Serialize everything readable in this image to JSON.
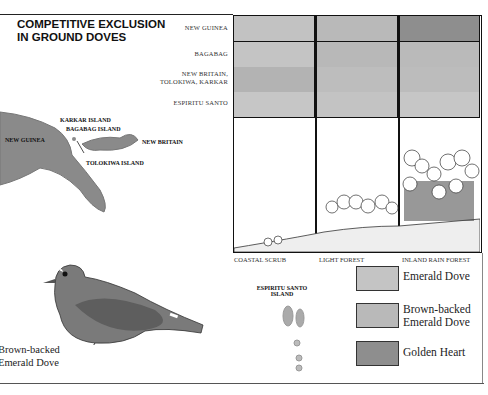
{
  "title": {
    "line1": "COMPETITIVE EXCLUSION",
    "line2": "IN GROUND DOVES"
  },
  "rows": [
    {
      "label_lines": [
        "NEW GUINEA"
      ],
      "colors": [
        "#c2c2c2",
        "#b9b9b9",
        "#8e8e8e"
      ]
    },
    {
      "label_lines": [
        "BAGABAG"
      ],
      "colors": [
        "#c4c4c4",
        "#b8b8b8",
        "#bababa"
      ]
    },
    {
      "label_lines": [
        "NEW BRITAIN,",
        "TOLOKIWA, KARKAR"
      ],
      "colors": [
        "#b3b3b3",
        "#bdbdbd",
        "#bcbcbc"
      ]
    },
    {
      "label_lines": [
        "ESPIRITU SANTO"
      ],
      "colors": [
        "#c6c6c6",
        "#c3c3c3",
        "#c6c6c6"
      ]
    }
  ],
  "habitats": [
    "COASTAL SCRUB",
    "LIGHT FOREST",
    "INLAND RAIN FOREST"
  ],
  "map_labels": {
    "karkar": "KARKAR ISLAND",
    "bagabag": "BAGABAG ISLAND",
    "new_guinea": "NEW GUINEA",
    "new_britain": "NEW BRITAIN",
    "tolokiwa": "TOLOKIWA ISLAND",
    "espiritu": "ESPIRITU SANTO",
    "espiritu2": "ISLAND"
  },
  "legend": [
    {
      "label_lines": [
        "Emerald Dove"
      ],
      "color": "#c4c4c4"
    },
    {
      "label_lines": [
        "Brown-backed",
        "Emerald Dove"
      ],
      "color": "#b9b9b9"
    },
    {
      "label_lines": [
        "Golden Heart"
      ],
      "color": "#8e8e8e"
    }
  ],
  "dove_caption": {
    "line1": "Brown-backed",
    "line2": "Emerald Dove"
  }
}
